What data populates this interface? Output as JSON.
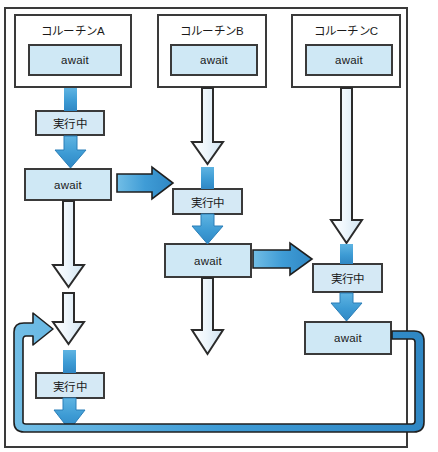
{
  "diagram": {
    "labels": {
      "await": "await",
      "running": "実行中"
    },
    "colors": {
      "frame_border": "#3a3a3a",
      "box_border": "#3a3a3a",
      "box_fill": "#cfe8f5",
      "active_arrow": "#3d9bd4",
      "idle_arrow_fill": "#eaf4fb",
      "idle_arrow_stroke": "#2b2b2b",
      "background": "#ffffff"
    },
    "columns": [
      {
        "id": "coroutine-a",
        "header": "コルーチンA",
        "header_await": "await",
        "steps": [
          {
            "kind": "running",
            "label": "実行中"
          },
          {
            "kind": "await",
            "label": "await"
          },
          {
            "kind": "running",
            "label": "実行中"
          }
        ]
      },
      {
        "id": "coroutine-b",
        "header": "コルーチンB",
        "header_await": "await",
        "steps": [
          {
            "kind": "running",
            "label": "実行中"
          },
          {
            "kind": "await",
            "label": "await"
          }
        ]
      },
      {
        "id": "coroutine-c",
        "header": "コルーチンC",
        "header_await": "await",
        "steps": [
          {
            "kind": "running",
            "label": "実行中"
          },
          {
            "kind": "await",
            "label": "await"
          }
        ]
      }
    ],
    "transitions": [
      {
        "id": "a-to-b",
        "from": "coroutine-a",
        "to": "coroutine-b"
      },
      {
        "id": "b-to-c",
        "from": "coroutine-b",
        "to": "coroutine-c"
      },
      {
        "id": "c-to-a",
        "from": "coroutine-c",
        "to": "coroutine-a"
      }
    ]
  }
}
